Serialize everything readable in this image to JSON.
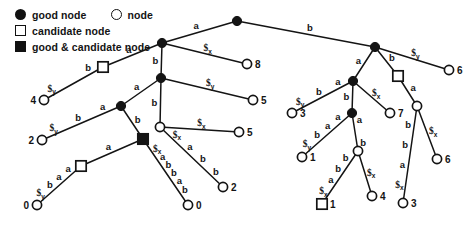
{
  "legend": {
    "rows": [
      {
        "swatch": "filled-circle",
        "label": "good node",
        "swatch2": "open-circle",
        "label2": "node"
      },
      {
        "swatch": "open-square",
        "label": "candidate node"
      },
      {
        "swatch": "filled-square",
        "label": "good & candidate node"
      }
    ],
    "items": [
      {
        "name": "good-node",
        "label": "good node",
        "shape": "filled-circle"
      },
      {
        "name": "node",
        "label": "node",
        "shape": "open-circle"
      },
      {
        "name": "candidate-node",
        "label": "candidate node",
        "shape": "open-square"
      },
      {
        "name": "good-and-candidate-node",
        "label": "good & candidate node",
        "shape": "filled-square"
      }
    ]
  },
  "colors": {
    "ink": "#141414",
    "paper": "#ffffff",
    "node_fill_good": "#111111",
    "node_fill_plain": "#ffffff"
  },
  "symbols": {
    "a": "a",
    "b": "b",
    "dollar_x": "$x",
    "dollar_y": "$y",
    "dollar": "$",
    "x": "x",
    "y": "y"
  },
  "diagram": {
    "type": "suffix-tree",
    "nodes": [
      {
        "id": "root",
        "kind": "good",
        "x": 237,
        "y": 21,
        "label": ""
      },
      {
        "id": "L1",
        "kind": "good",
        "x": 162,
        "y": 43,
        "label": ""
      },
      {
        "id": "L2",
        "kind": "candidate",
        "x": 103,
        "y": 67,
        "label": ""
      },
      {
        "id": "L3",
        "kind": "plain",
        "x": 44,
        "y": 100,
        "label": "4"
      },
      {
        "id": "L4",
        "kind": "good",
        "x": 161,
        "y": 78,
        "label": ""
      },
      {
        "id": "L5",
        "kind": "plain",
        "x": 247,
        "y": 64,
        "label": "8"
      },
      {
        "id": "L6",
        "kind": "good",
        "x": 121,
        "y": 106,
        "label": ""
      },
      {
        "id": "L7",
        "kind": "plain",
        "x": 42,
        "y": 140,
        "label": "2"
      },
      {
        "id": "L8",
        "kind": "plain",
        "x": 253,
        "y": 100,
        "label": "5"
      },
      {
        "id": "L9",
        "kind": "goodcand",
        "x": 143,
        "y": 139,
        "label": ""
      },
      {
        "id": "L10",
        "kind": "plain",
        "x": 160,
        "y": 127,
        "label": ""
      },
      {
        "id": "L11",
        "kind": "candidate",
        "x": 81,
        "y": 166,
        "label": ""
      },
      {
        "id": "L12",
        "kind": "plain",
        "x": 37,
        "y": 205,
        "label": "0"
      },
      {
        "id": "L13",
        "kind": "plain",
        "x": 188,
        "y": 205,
        "label": "0"
      },
      {
        "id": "L14",
        "kind": "plain",
        "x": 223,
        "y": 187,
        "label": "2"
      },
      {
        "id": "L15",
        "kind": "plain",
        "x": 239,
        "y": 132,
        "label": "5"
      },
      {
        "id": "R1",
        "kind": "good",
        "x": 375,
        "y": 47,
        "label": ""
      },
      {
        "id": "R2",
        "kind": "plain",
        "x": 449,
        "y": 70,
        "label": "6"
      },
      {
        "id": "R3",
        "kind": "good",
        "x": 353,
        "y": 81,
        "label": ""
      },
      {
        "id": "R4",
        "kind": "candidate",
        "x": 398,
        "y": 76,
        "label": ""
      },
      {
        "id": "R5",
        "kind": "plain",
        "x": 292,
        "y": 113,
        "label": "3"
      },
      {
        "id": "R6",
        "kind": "good",
        "x": 352,
        "y": 113,
        "label": ""
      },
      {
        "id": "R7",
        "kind": "plain",
        "x": 390,
        "y": 113,
        "label": "7"
      },
      {
        "id": "R8",
        "kind": "plain",
        "x": 417,
        "y": 106,
        "label": ""
      },
      {
        "id": "R9",
        "kind": "plain",
        "x": 302,
        "y": 157,
        "label": "1"
      },
      {
        "id": "R10",
        "kind": "plain",
        "x": 358,
        "y": 151,
        "label": ""
      },
      {
        "id": "R11",
        "kind": "plain",
        "x": 437,
        "y": 159,
        "label": "6"
      },
      {
        "id": "R12",
        "kind": "plain",
        "x": 403,
        "y": 203,
        "label": "3"
      },
      {
        "id": "R13",
        "kind": "candidate",
        "x": 322,
        "y": 204,
        "label": "1"
      },
      {
        "id": "R14",
        "kind": "plain",
        "x": 372,
        "y": 196,
        "label": "4"
      }
    ],
    "edges": [
      {
        "from": "root",
        "to": "L1",
        "labels": [
          "a"
        ]
      },
      {
        "from": "root",
        "to": "R1",
        "labels": [
          "b"
        ]
      },
      {
        "from": "L1",
        "to": "L2",
        "labels": [
          "a"
        ]
      },
      {
        "from": "L1",
        "to": "L5",
        "labels": [
          "$x"
        ]
      },
      {
        "from": "L1",
        "to": "L4",
        "labels": [
          "b"
        ]
      },
      {
        "from": "L2",
        "to": "L3",
        "labels": [
          "$y",
          "b"
        ]
      },
      {
        "from": "L4",
        "to": "L6",
        "labels": [
          "a"
        ]
      },
      {
        "from": "L4",
        "to": "L8",
        "labels": [
          "$y"
        ]
      },
      {
        "from": "L4",
        "to": "L10",
        "labels": [
          "b"
        ]
      },
      {
        "from": "L6",
        "to": "L7",
        "labels": [
          "$y",
          "b",
          "a"
        ]
      },
      {
        "from": "L6",
        "to": "L9",
        "labels": [
          "b"
        ]
      },
      {
        "from": "L9",
        "to": "L11",
        "labels": [
          "a"
        ]
      },
      {
        "from": "L9",
        "to": "L13",
        "labels": [
          "b",
          "a",
          "b",
          "b",
          "a",
          "$x"
        ]
      },
      {
        "from": "L11",
        "to": "L12",
        "labels": [
          "$y",
          "b",
          "a",
          "a"
        ]
      },
      {
        "from": "L10",
        "to": "L15",
        "labels": [
          "$x"
        ]
      },
      {
        "from": "L10",
        "to": "L14",
        "labels": [
          "b",
          "b",
          "a",
          "$x"
        ]
      },
      {
        "from": "R1",
        "to": "R2",
        "labels": [
          "$y"
        ]
      },
      {
        "from": "R1",
        "to": "R3",
        "labels": [
          "a"
        ]
      },
      {
        "from": "R1",
        "to": "R4",
        "labels": [
          "b"
        ]
      },
      {
        "from": "R3",
        "to": "R5",
        "labels": [
          "$y",
          "b",
          "a"
        ]
      },
      {
        "from": "R3",
        "to": "R7",
        "labels": [
          "$x"
        ]
      },
      {
        "from": "R3",
        "to": "R6",
        "labels": [
          "b"
        ]
      },
      {
        "from": "R6",
        "to": "R9",
        "labels": [
          "$y",
          "b",
          "a",
          "a"
        ]
      },
      {
        "from": "R6",
        "to": "R10",
        "labels": [
          "b",
          "a"
        ]
      },
      {
        "from": "R10",
        "to": "R13",
        "labels": [
          "$x",
          "a",
          "b",
          "b"
        ]
      },
      {
        "from": "R10",
        "to": "R14",
        "labels": [
          "$x"
        ]
      },
      {
        "from": "R4",
        "to": "R8",
        "labels": [
          "a"
        ]
      },
      {
        "from": "R8",
        "to": "R12",
        "labels": [
          "$x",
          "a",
          "b",
          "b"
        ]
      },
      {
        "from": "R8",
        "to": "R11",
        "labels": [
          "$x"
        ]
      }
    ],
    "leaf_values": [
      "4",
      "2",
      "0",
      "8",
      "5",
      "0",
      "2",
      "6",
      "3",
      "7",
      "1",
      "1",
      "4",
      "6",
      "3"
    ]
  }
}
